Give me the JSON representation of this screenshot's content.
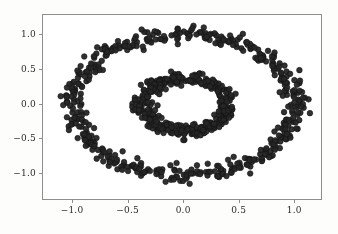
{
  "figure": {
    "background_color": "#fdfdfb",
    "axes_background_color": "#ffffff",
    "spine_color": "#8e8e8e",
    "tick_label_color": "#2b2b2b"
  },
  "chart_data": {
    "type": "scatter",
    "title": "",
    "xlabel": "",
    "ylabel": "",
    "xlim": [
      -1.27,
      1.25
    ],
    "ylim": [
      -1.38,
      1.28
    ],
    "xticks": [
      -1.0,
      -0.5,
      0.0,
      0.5,
      1.0
    ],
    "yticks": [
      -1.0,
      -0.5,
      0.0,
      0.5,
      1.0
    ],
    "xtick_labels": [
      "−1.0",
      "−0.5",
      "0.0",
      "0.5",
      "1.0"
    ],
    "ytick_labels": [
      "−1.0",
      "−0.5",
      "0.0",
      "0.5",
      "1.0"
    ],
    "grid": false,
    "legend": null,
    "marker": {
      "shape": "circle",
      "color": "#262626",
      "edge_color": "#111111",
      "size_px": 5.6,
      "alpha": 0.95
    },
    "series": [
      {
        "name": "outer-ring",
        "n_points": 500,
        "shape": "ring",
        "center": [
          0.0,
          0.0
        ],
        "radius": 1.0,
        "noise_sigma": 0.055
      },
      {
        "name": "inner-ring",
        "n_points": 400,
        "shape": "ring",
        "center": [
          0.0,
          0.0
        ],
        "radius": 0.38,
        "noise_sigma": 0.045
      }
    ]
  }
}
